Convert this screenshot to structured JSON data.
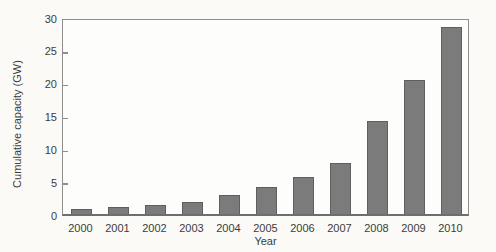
{
  "figure": {
    "background_color": "#fbfaf6",
    "plot_background_color": "#fdfdfc",
    "bar_color": "#7b7b7b",
    "bar_border_color": "#5f5f5f",
    "frame_color": "#8e8e8e",
    "axis_color": "#6e6e6e",
    "text_color": "#3c3c3c"
  },
  "chart_data": {
    "type": "bar",
    "title": "",
    "xlabel": "Year",
    "ylabel": "Cumulative capacity (GW)",
    "categories": [
      "2000",
      "2001",
      "2002",
      "2003",
      "2004",
      "2005",
      "2006",
      "2007",
      "2008",
      "2009",
      "2010"
    ],
    "values": [
      0.8,
      1.1,
      1.4,
      1.9,
      2.9,
      4.1,
      5.6,
      7.8,
      14.1,
      20.4,
      28.5
    ],
    "ylim": [
      0,
      30
    ],
    "yticks": [
      0,
      5,
      10,
      15,
      20,
      25,
      30
    ],
    "grid": false,
    "legend": null,
    "bar_width_px": 21
  }
}
